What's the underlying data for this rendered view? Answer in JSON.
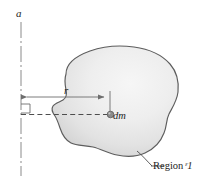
{
  "figure": {
    "type": "mechanics-moment-of-inertia-diagram",
    "axis_label": "a",
    "radius_label": "r",
    "mass_element_label": "dm",
    "region_label_prefix": "Region",
    "region_label_symbol": "ᵋ1",
    "region_label_text": "Region 𝒱",
    "colors": {
      "outline": "#5d5d5d",
      "fill_light": "#f3f3f3",
      "fill_mid": "#e3e3e3",
      "fill_dark": "#d2d2d2",
      "line": "#6e6e6e",
      "axis": "#8a8a8a",
      "text": "#1d1d1d",
      "mass_point": "#8c8c8c",
      "background": "#ffffff"
    },
    "geometry": {
      "axis_x": 21,
      "axis_top_y": 22,
      "axis_bottom_y": 176,
      "radius_line_y": 97,
      "radius_start_x": 21,
      "radius_end_x": 110,
      "dashed_line_y": 115,
      "dashed_start_x": 21,
      "dashed_end_x": 110,
      "mass_point_x": 110,
      "mass_point_y": 115,
      "right_angle_box": {
        "x": 21,
        "y": 104,
        "size": 9
      },
      "leader_start": {
        "x": 137,
        "y": 151
      },
      "leader_end": {
        "x": 152,
        "y": 166
      }
    }
  }
}
